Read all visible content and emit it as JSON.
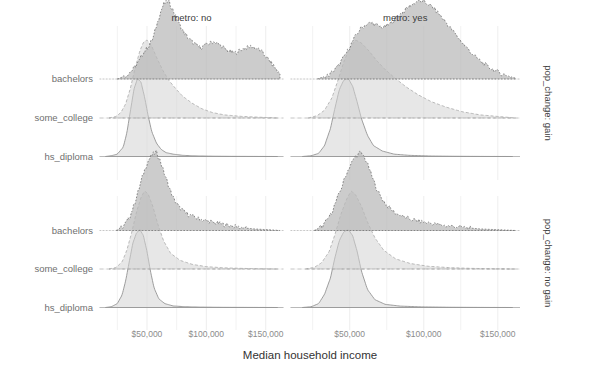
{
  "figure": {
    "type": "ridgeline",
    "axis_title_x": "Median household income",
    "x_tick_labels": [
      "$50,000",
      "$100,000",
      "$150,000"
    ],
    "x_ticks": [
      50000,
      100000,
      150000
    ],
    "xlim": [
      10000,
      165000
    ],
    "y_categories": [
      "hs_diploma",
      "some_college",
      "bachelors"
    ],
    "col_strip_labels": [
      "metro: no",
      "metro: yes"
    ],
    "row_strip_labels": [
      "pop_change: gain",
      "pop_change: no gain"
    ],
    "colors": {
      "hs_diploma_fill": "#d9d9d9",
      "some_college_fill": "#d3d3d3",
      "bachelors_fill": "#b8b8b8",
      "grid": "#f2f2f2",
      "baseline": "#9c9c9c",
      "text": "#6f6f6f",
      "tick_text": "#8c8c8c"
    }
  },
  "chart_data": {
    "type": "area",
    "title": "",
    "xlabel": "Median household income",
    "ylabel": "",
    "xlim": [
      10000,
      165000
    ],
    "grid": true,
    "legend": "none",
    "facet_cols": [
      "metro: no",
      "metro: yes"
    ],
    "facet_rows": [
      "pop_change: gain",
      "pop_change: no gain"
    ],
    "ridge_categories": [
      "hs_diploma",
      "some_college",
      "bachelors"
    ],
    "x_tick_labels": [
      "$50,000",
      "$100,000",
      "$150,000"
    ],
    "x_ticks": [
      50000,
      100000,
      150000
    ],
    "panels": [
      {
        "row": "pop_change: gain",
        "col": "metro: no",
        "series": [
          {
            "name": "hs_diploma",
            "x": [
              15000,
              20000,
              25000,
              30000,
              33000,
              36000,
              39000,
              42000,
              45000,
              48000,
              51000,
              54000,
              58000,
              62000,
              66000,
              72000,
              80000,
              90000,
              105000,
              120000,
              140000,
              160000
            ],
            "y": [
              0.0,
              0.01,
              0.03,
              0.12,
              0.3,
              0.58,
              0.86,
              1.0,
              0.95,
              0.76,
              0.52,
              0.32,
              0.17,
              0.09,
              0.05,
              0.03,
              0.015,
              0.008,
              0.004,
              0.002,
              0.001,
              0.0
            ]
          },
          {
            "name": "some_college",
            "x": [
              18000,
              24000,
              28000,
              32000,
              36000,
              40000,
              44000,
              47000,
              50000,
              54000,
              58000,
              63000,
              68000,
              74000,
              80000,
              88000,
              96000,
              105000,
              115000,
              130000,
              145000,
              160000
            ],
            "y": [
              0.0,
              0.02,
              0.07,
              0.18,
              0.38,
              0.64,
              0.86,
              0.97,
              1.0,
              0.92,
              0.78,
              0.62,
              0.49,
              0.38,
              0.28,
              0.19,
              0.12,
              0.07,
              0.04,
              0.02,
              0.01,
              0.0
            ]
          },
          {
            "name": "bachelors",
            "x": [
              25000,
              32000,
              38000,
              43000,
              47000,
              51000,
              55000,
              58000,
              61000,
              64000,
              68000,
              72000,
              76000,
              80000,
              85000,
              90000,
              95000,
              100000,
              106000,
              112000,
              118000,
              124000,
              130000,
              138000,
              146000,
              155000,
              162000
            ],
            "y": [
              0.0,
              0.04,
              0.12,
              0.22,
              0.34,
              0.41,
              0.52,
              0.68,
              0.84,
              0.96,
              1.0,
              0.88,
              0.74,
              0.62,
              0.52,
              0.45,
              0.4,
              0.44,
              0.48,
              0.43,
              0.36,
              0.33,
              0.38,
              0.42,
              0.36,
              0.2,
              0.06
            ]
          }
        ]
      },
      {
        "row": "pop_change: gain",
        "col": "metro: yes",
        "series": [
          {
            "name": "hs_diploma",
            "x": [
              18000,
              24000,
              29000,
              33000,
              37000,
              40000,
              43000,
              46000,
              49000,
              52000,
              55000,
              58000,
              62000,
              66000,
              72000,
              80000,
              90000,
              105000,
              120000,
              140000,
              160000
            ],
            "y": [
              0.0,
              0.01,
              0.04,
              0.14,
              0.36,
              0.62,
              0.86,
              0.98,
              1.0,
              0.9,
              0.7,
              0.48,
              0.27,
              0.14,
              0.07,
              0.03,
              0.015,
              0.006,
              0.003,
              0.001,
              0.0
            ]
          },
          {
            "name": "some_college",
            "x": [
              22000,
              28000,
              33000,
              38000,
              42000,
              46000,
              50000,
              54000,
              58000,
              63000,
              68000,
              74000,
              80000,
              88000,
              96000,
              105000,
              115000,
              126000,
              138000,
              150000,
              162000
            ],
            "y": [
              0.0,
              0.03,
              0.1,
              0.26,
              0.48,
              0.72,
              0.9,
              1.0,
              0.96,
              0.86,
              0.74,
              0.62,
              0.52,
              0.4,
              0.3,
              0.21,
              0.14,
              0.08,
              0.04,
              0.02,
              0.0
            ]
          },
          {
            "name": "bachelors",
            "x": [
              28000,
              36000,
              42000,
              48000,
              53000,
              57000,
              61000,
              65000,
              69000,
              73000,
              77000,
              81000,
              86000,
              91000,
              96000,
              101000,
              106000,
              111000,
              116000,
              122000,
              128000,
              135000,
              143000,
              152000,
              162000
            ],
            "y": [
              0.0,
              0.05,
              0.16,
              0.34,
              0.52,
              0.64,
              0.7,
              0.72,
              0.68,
              0.66,
              0.7,
              0.78,
              0.86,
              0.94,
              1.0,
              0.98,
              0.92,
              0.82,
              0.7,
              0.56,
              0.42,
              0.28,
              0.16,
              0.07,
              0.01
            ]
          }
        ]
      },
      {
        "row": "pop_change: no gain",
        "col": "metro: no",
        "series": [
          {
            "name": "hs_diploma",
            "x": [
              15000,
              20000,
              25000,
              29000,
              32000,
              35000,
              38000,
              41000,
              44000,
              47000,
              50000,
              53000,
              56000,
              60000,
              65000,
              72000,
              82000,
              95000,
              115000,
              140000,
              160000
            ],
            "y": [
              0.0,
              0.01,
              0.05,
              0.16,
              0.34,
              0.58,
              0.82,
              0.95,
              1.0,
              0.92,
              0.72,
              0.46,
              0.25,
              0.11,
              0.05,
              0.02,
              0.01,
              0.005,
              0.002,
              0.001,
              0.0
            ]
          },
          {
            "name": "some_college",
            "x": [
              18000,
              24000,
              29000,
              33000,
              37000,
              41000,
              45000,
              48000,
              51000,
              55000,
              59000,
              64000,
              70000,
              78000,
              88000,
              100000,
              115000,
              130000,
              145000,
              160000
            ],
            "y": [
              0.0,
              0.02,
              0.09,
              0.24,
              0.46,
              0.72,
              0.92,
              1.0,
              0.96,
              0.8,
              0.58,
              0.36,
              0.2,
              0.11,
              0.06,
              0.03,
              0.015,
              0.008,
              0.003,
              0.0
            ]
          },
          {
            "name": "bachelors",
            "x": [
              24000,
              30000,
              35000,
              39000,
              43000,
              46000,
              49000,
              52000,
              55000,
              58000,
              61000,
              64000,
              68000,
              72000,
              77000,
              83000,
              90000,
              98000,
              107000,
              117000,
              128000,
              140000,
              152000,
              162000
            ],
            "y": [
              0.0,
              0.05,
              0.16,
              0.32,
              0.52,
              0.68,
              0.82,
              0.92,
              0.98,
              1.0,
              0.9,
              0.76,
              0.58,
              0.42,
              0.3,
              0.22,
              0.17,
              0.13,
              0.1,
              0.07,
              0.04,
              0.02,
              0.01,
              0.0
            ]
          }
        ]
      },
      {
        "row": "pop_change: no gain",
        "col": "metro: yes",
        "series": [
          {
            "name": "hs_diploma",
            "x": [
              18000,
              24000,
              29000,
              33000,
              37000,
              40000,
              43000,
              46000,
              49000,
              52000,
              55000,
              58000,
              62000,
              67000,
              74000,
              84000,
              98000,
              118000,
              140000,
              160000
            ],
            "y": [
              0.0,
              0.01,
              0.05,
              0.17,
              0.38,
              0.64,
              0.86,
              0.97,
              1.0,
              0.92,
              0.72,
              0.46,
              0.23,
              0.1,
              0.04,
              0.018,
              0.008,
              0.003,
              0.001,
              0.0
            ]
          },
          {
            "name": "some_college",
            "x": [
              20000,
              26000,
              31000,
              36000,
              40000,
              44000,
              48000,
              51000,
              54000,
              58000,
              62000,
              67000,
              73000,
              81000,
              91000,
              103000,
              117000,
              132000,
              148000,
              162000
            ],
            "y": [
              0.0,
              0.02,
              0.08,
              0.22,
              0.44,
              0.7,
              0.9,
              1.0,
              0.95,
              0.8,
              0.6,
              0.4,
              0.24,
              0.13,
              0.07,
              0.035,
              0.018,
              0.008,
              0.003,
              0.0
            ]
          },
          {
            "name": "bachelors",
            "x": [
              26000,
              32000,
              37000,
              41000,
              45000,
              48000,
              51000,
              54000,
              57000,
              60000,
              63000,
              66000,
              70000,
              75000,
              81000,
              88000,
              96000,
              105000,
              115000,
              126000,
              138000,
              150000,
              162000
            ],
            "y": [
              0.0,
              0.06,
              0.2,
              0.38,
              0.58,
              0.74,
              0.86,
              0.95,
              1.0,
              0.94,
              0.8,
              0.64,
              0.46,
              0.32,
              0.22,
              0.16,
              0.12,
              0.09,
              0.06,
              0.04,
              0.02,
              0.01,
              0.0
            ]
          }
        ]
      }
    ]
  }
}
